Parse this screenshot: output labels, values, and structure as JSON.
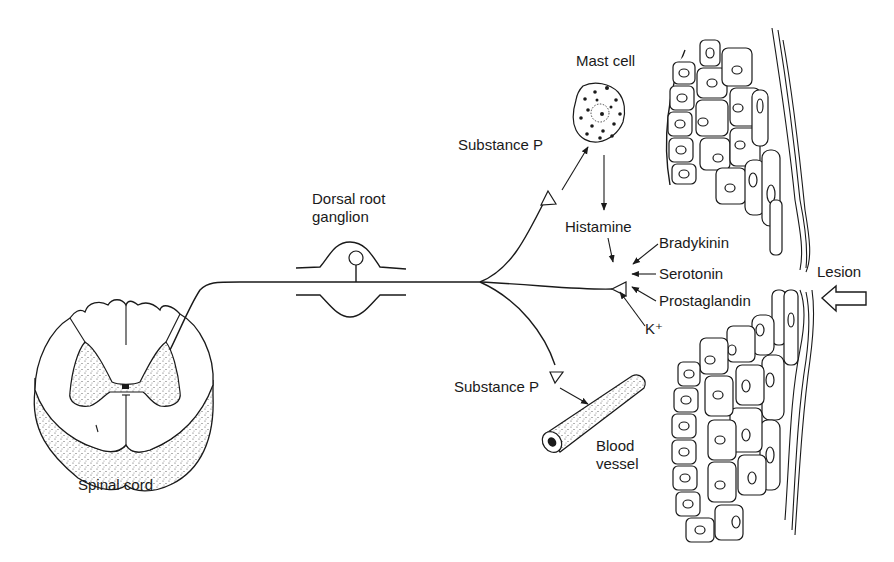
{
  "diagram": {
    "type": "anatomical-illustration",
    "colors": {
      "ink": "#1a1a1a",
      "background": "#ffffff",
      "stipple": "#555555"
    },
    "labels": {
      "spinal_cord": "Spinal cord",
      "dorsal_root_ganglion_line1": "Dorsal root",
      "dorsal_root_ganglion_line2": "ganglion",
      "mast_cell": "Mast cell",
      "substance_p_top": "Substance P",
      "substance_p_bottom": "Substance P",
      "histamine": "Histamine",
      "bradykinin": "Bradykinin",
      "serotonin": "Serotonin",
      "prostaglandin": "Prostaglandin",
      "potassium": "K⁺",
      "lesion": "Lesion",
      "blood_vessel_line1": "Blood",
      "blood_vessel_line2": "vessel"
    },
    "nodes": [
      {
        "id": "spinal_cord",
        "label": "Spinal cord"
      },
      {
        "id": "drg",
        "label": "Dorsal root ganglion"
      },
      {
        "id": "mast_cell",
        "label": "Mast cell"
      },
      {
        "id": "blood_vessel",
        "label": "Blood vessel"
      },
      {
        "id": "nerve_terminal",
        "label": "Free nerve ending"
      },
      {
        "id": "lesion",
        "label": "Lesion"
      }
    ],
    "edges": [
      {
        "from": "nerve_terminal_top",
        "to": "mast_cell",
        "label": "Substance P"
      },
      {
        "from": "mast_cell",
        "to": "nerve_terminal",
        "label": "Histamine"
      },
      {
        "from": "bradykinin",
        "to": "nerve_terminal",
        "label": "Bradykinin"
      },
      {
        "from": "serotonin",
        "to": "nerve_terminal",
        "label": "Serotonin"
      },
      {
        "from": "prostaglandin",
        "to": "nerve_terminal",
        "label": "Prostaglandin"
      },
      {
        "from": "potassium",
        "to": "nerve_terminal",
        "label": "K⁺"
      },
      {
        "from": "nerve_terminal_bottom",
        "to": "blood_vessel",
        "label": "Substance P"
      },
      {
        "from": "lesion_arrow",
        "to": "lesion",
        "label": "Lesion"
      }
    ]
  }
}
